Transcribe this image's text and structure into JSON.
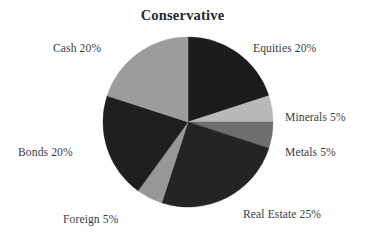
{
  "chart_data": {
    "type": "pie",
    "title": "Conservative",
    "xlabel": "",
    "ylabel": "",
    "legend_position": "none",
    "grid": false,
    "start_angle_deg": 0,
    "direction": "clockwise",
    "categories": [
      "Equities",
      "Minerals",
      "Metals",
      "Real Estate",
      "Foreign",
      "Bonds",
      "Cash"
    ],
    "values": [
      20,
      5,
      5,
      25,
      5,
      20,
      20
    ],
    "unit": "%",
    "slices": [
      {
        "name": "Equities",
        "value": 20,
        "label": "Equities 20%",
        "color": "#1c1c1c"
      },
      {
        "name": "Minerals",
        "value": 5,
        "label": "Minerals 5%",
        "color": "#b9b9b9"
      },
      {
        "name": "Metals",
        "value": 5,
        "label": "Metals 5%",
        "color": "#6e6e6e"
      },
      {
        "name": "Real Estate",
        "value": 25,
        "label": "Real Estate 25%",
        "color": "#242424"
      },
      {
        "name": "Foreign",
        "value": 5,
        "label": "Foreign 5%",
        "color": "#989898"
      },
      {
        "name": "Bonds",
        "value": 20,
        "label": "Bonds 20%",
        "color": "#1f1f1f"
      },
      {
        "name": "Cash",
        "value": 20,
        "label": "Cash 20%",
        "color": "#9c9c9c"
      }
    ]
  },
  "labels": {
    "equities": "Equities 20%",
    "minerals": "Minerals 5%",
    "metals": "Metals 5%",
    "real_estate": "Real Estate 25%",
    "foreign": "Foreign 5%",
    "bonds": "Bonds 20%",
    "cash": "Cash 20%"
  }
}
